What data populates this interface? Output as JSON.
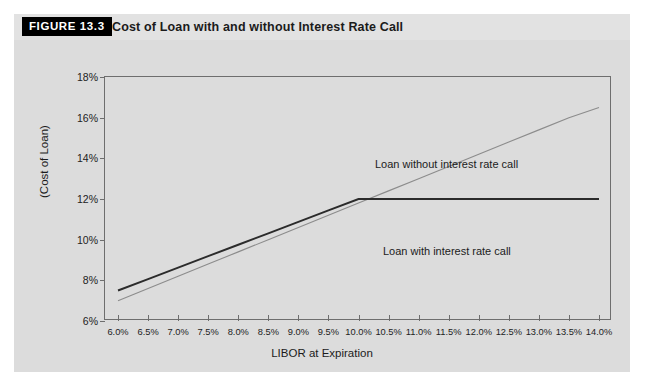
{
  "figure": {
    "tag": "FIGURE 13.3",
    "title": "Cost of Loan with and without Interest Rate Call"
  },
  "colors": {
    "page_background": "#ffffff",
    "title_band": "#e2e2e2",
    "panel_background": "#dcdcdc",
    "tag_background": "#000000",
    "tag_text": "#ffffff",
    "axis": "#6e6e6e",
    "series_with_call": "#2b2b2b",
    "series_without_call": "#8c8c8c",
    "text": "#1b1b1b"
  },
  "chart_data": {
    "type": "line",
    "title": "Cost of Loan with and without Interest Rate Call",
    "xlabel": "LIBOR at Expiration",
    "ylabel": "(Cost of Loan)",
    "xlim": [
      6.0,
      14.0
    ],
    "ylim": [
      6,
      18
    ],
    "grid": false,
    "legend_position": "inline-annotations",
    "x": [
      6.0,
      6.5,
      7.0,
      7.5,
      8.0,
      8.5,
      9.0,
      9.5,
      10.0,
      10.5,
      11.0,
      11.5,
      12.0,
      12.5,
      13.0,
      13.5,
      14.0
    ],
    "xtick_labels": [
      "6.0%",
      "6.5%",
      "7.0%",
      "7.5%",
      "8.0%",
      "8.5%",
      "9.0%",
      "9.5%",
      "10.0%",
      "10.5%",
      "11.0%",
      "11.5%",
      "12.0%",
      "12.5%",
      "13.0%",
      "13.5%",
      "14.0%"
    ],
    "ytick_values": [
      6,
      8,
      10,
      12,
      14,
      16,
      18
    ],
    "ytick_labels": [
      "6%",
      "8%",
      "10%",
      "12%",
      "14%",
      "16%",
      "18%"
    ],
    "series": [
      {
        "name": "Loan without interest rate call",
        "annotation": "Loan without interest rate call",
        "style": "thin",
        "color": "#8c8c8c",
        "values": [
          7.0,
          7.6,
          8.2,
          8.8,
          9.4,
          10.0,
          10.6,
          11.2,
          11.8,
          12.4,
          13.0,
          13.6,
          14.2,
          14.8,
          15.4,
          16.0,
          16.5
        ]
      },
      {
        "name": "Loan with interest rate call",
        "annotation": "Loan with interest rate call",
        "style": "thick",
        "color": "#2b2b2b",
        "values": [
          7.5,
          8.06,
          8.62,
          9.19,
          9.75,
          10.31,
          10.87,
          11.44,
          12.0,
          12.0,
          12.0,
          12.0,
          12.0,
          12.0,
          12.0,
          12.0,
          12.0
        ]
      }
    ],
    "annotations": [
      {
        "text": "Loan without interest rate call",
        "x": 10.6,
        "y": 15.3
      },
      {
        "text": "Loan with interest rate call",
        "x": 10.8,
        "y": 11.1
      }
    ]
  }
}
